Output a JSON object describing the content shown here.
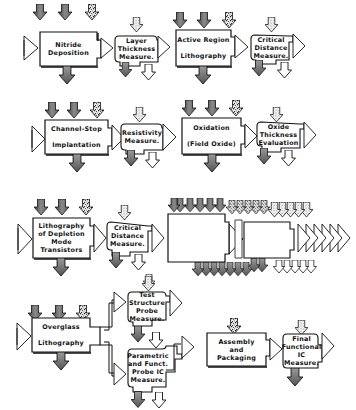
{
  "diagram": {
    "type": "process-flow",
    "colors": {
      "outline": "#111111",
      "box_fill": "#ffffff",
      "input_arrow_dark": "#6a6a6a",
      "input_arrow_light": "#cfcfcf",
      "output_arrow": "#7a7a7a"
    },
    "rows": [
      {
        "steps": [
          {
            "id": "nitride",
            "kind": "process",
            "label": "Nitride\nDeposition"
          },
          {
            "id": "layer-thickness",
            "kind": "measure",
            "label": "Layer\nThickness\nMeasure."
          },
          {
            "id": "active-region",
            "kind": "process",
            "label": "Active Region\n\nLithography"
          },
          {
            "id": "critical-distance-1",
            "kind": "measure",
            "label": "Critical\nDistance\nMeasure."
          }
        ]
      },
      {
        "steps": [
          {
            "id": "channel-stop",
            "kind": "process",
            "label": "Channel-Stop\n\nImplantation"
          },
          {
            "id": "resistivity",
            "kind": "measure",
            "label": "Resistivity\nMeasure."
          },
          {
            "id": "oxidation",
            "kind": "process",
            "label": "Oxidation\n\n(Field Oxide)"
          },
          {
            "id": "oxide-thickness",
            "kind": "measure",
            "label": "Oxide\nThickness\nEvaluation"
          }
        ]
      },
      {
        "steps": [
          {
            "id": "depletion-litho",
            "kind": "process",
            "label": "Lithography\nof Depletion\nMode\nTransistors"
          },
          {
            "id": "critical-distance-2",
            "kind": "measure",
            "label": "Critical\nDistance\nMeasure."
          },
          {
            "id": "repeated-steps",
            "kind": "stacked",
            "label": ""
          }
        ]
      },
      {
        "steps": [
          {
            "id": "overglass",
            "kind": "process",
            "label": "Overglass\n\nLithography"
          },
          {
            "id": "test-structure",
            "kind": "measure",
            "label": "Test\nStructure\nProbe\nMeasure."
          },
          {
            "id": "parametric",
            "kind": "measure",
            "label": "Parametric\nand Funct.\nProbe IC\nMeasure."
          },
          {
            "id": "assembly",
            "kind": "process",
            "label": "Assembly\nand\nPackaging"
          },
          {
            "id": "final-functional",
            "kind": "measure",
            "label": "Final\nFunctional\nIC\nMeasure."
          }
        ]
      }
    ]
  }
}
